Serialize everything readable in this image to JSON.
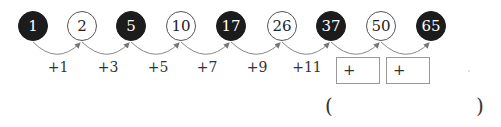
{
  "sequence": [
    {
      "value": "1",
      "style": "dark"
    },
    {
      "value": "2",
      "style": "light"
    },
    {
      "value": "5",
      "style": "dark"
    },
    {
      "value": "10",
      "style": "light"
    },
    {
      "value": "17",
      "style": "dark"
    },
    {
      "value": "26",
      "style": "light"
    },
    {
      "value": "37",
      "style": "dark"
    },
    {
      "value": "50",
      "style": "light"
    },
    {
      "value": "65",
      "style": "dark"
    }
  ],
  "steps": [
    "+1",
    "+3",
    "+5",
    "+7",
    "+9",
    "+11"
  ],
  "blank_steps": [
    "+",
    "+"
  ],
  "answer": {
    "open": "(",
    "close": ")",
    "value": ""
  }
}
